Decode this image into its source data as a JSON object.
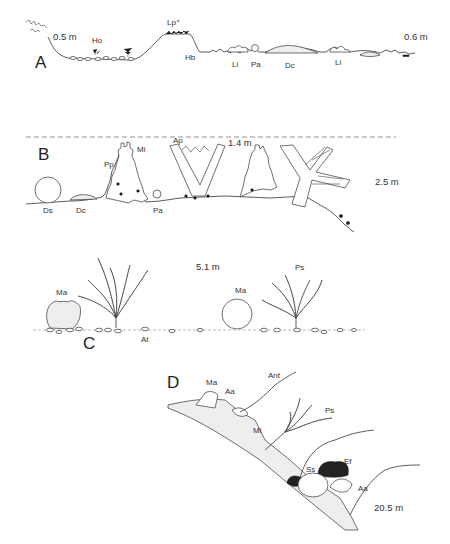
{
  "figure": {
    "panels": [
      {
        "id": "A",
        "depths": [
          "0.5 m",
          "0.6 m"
        ],
        "labels": [
          "Ho",
          "Lp⁺",
          "Hb",
          "Li",
          "Pa",
          "Dc",
          "Li"
        ]
      },
      {
        "id": "B",
        "depths": [
          "1.4 m",
          "2.5 m"
        ],
        "labels": [
          "Mi",
          "Ap",
          "Pp",
          "Ds",
          "Dc",
          "Pa"
        ]
      },
      {
        "id": "C",
        "depths": [
          "5.1 m"
        ],
        "labels": [
          "Ma",
          "Ma",
          "Ps",
          "At"
        ]
      },
      {
        "id": "D",
        "depths": [
          "20.5 m"
        ],
        "labels": [
          "Ma",
          "Aa",
          "Ant",
          "Ps",
          "Mi",
          "Ss",
          "Ef",
          "Aa"
        ]
      }
    ]
  }
}
